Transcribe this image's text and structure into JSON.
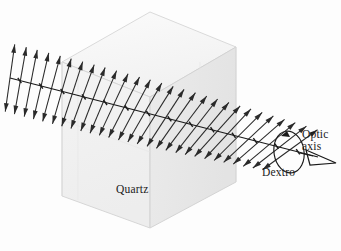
{
  "figure": {
    "background_color": "#fdfdfd",
    "ink_color": "#1a1a1a"
  },
  "labels": {
    "material": "Quartz",
    "optic_axis_line1": "Optic",
    "optic_axis_line2": "axis",
    "rotation_sense": "Dextro"
  },
  "crystal": {
    "name": "quartz-cube",
    "face_color_front": "#f2f2f2",
    "face_color_side": "#ebebeb",
    "face_color_top": "#f7f7f7",
    "edge_color": "#cfcfcf",
    "vertices": {
      "top_back": [
        150,
        12
      ],
      "top_left": [
        62,
        62
      ],
      "top_right": [
        236,
        47
      ],
      "top_front": [
        150,
        97
      ],
      "bottom_left": [
        62,
        196
      ],
      "bottom_front": [
        150,
        228
      ],
      "bottom_right": [
        236,
        182
      ]
    }
  },
  "beam": {
    "name": "optic-axis-beam",
    "start": [
      10,
      78
    ],
    "end": [
      330,
      160
    ],
    "color": "#1a1a1a",
    "tick_count": 14
  },
  "polarization_arrows": {
    "count": 28,
    "description": "double-headed arrows perpendicular to beam, rotating progressively from vertical (left) to tilted (right)",
    "start_angle_deg": 82,
    "end_angle_deg": 36,
    "half_length": 34,
    "color": "#2a2a2a"
  },
  "rotation_indicator": {
    "name": "rotation-ellipse",
    "center": [
      289,
      152
    ],
    "rx": 15,
    "ry": 21,
    "color": "#1a1a1a"
  },
  "axis_arrowhead": {
    "name": "optic-axis-arrowhead",
    "tip": [
      336,
      163
    ],
    "filled": false,
    "color": "#1a1a1a"
  },
  "chart_data": {
    "type": "scatter",
    "xlabel": "distance along optic axis",
    "ylabel": "plane of polarization angle (deg)",
    "x": [
      0,
      1,
      2,
      3,
      4,
      5,
      6,
      7,
      8,
      9,
      10,
      11,
      12,
      13,
      14,
      15,
      16,
      17,
      18,
      19,
      20,
      21,
      22,
      23,
      24,
      25,
      26,
      27
    ],
    "values": [
      82,
      80,
      79,
      77,
      75,
      74,
      72,
      70,
      69,
      67,
      65,
      63,
      62,
      60,
      58,
      57,
      55,
      53,
      52,
      50,
      48,
      47,
      45,
      43,
      41,
      40,
      38,
      36
    ],
    "annotations": [
      "Quartz",
      "Optic axis",
      "Dextro"
    ],
    "legend": []
  }
}
